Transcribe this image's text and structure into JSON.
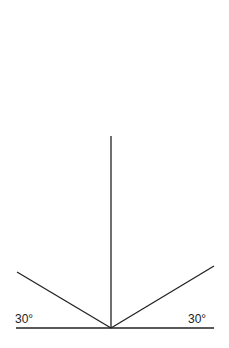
{
  "diagram": {
    "labels": {
      "left_angle": "30°",
      "right_angle": "30°"
    },
    "line_color": "#222222"
  }
}
